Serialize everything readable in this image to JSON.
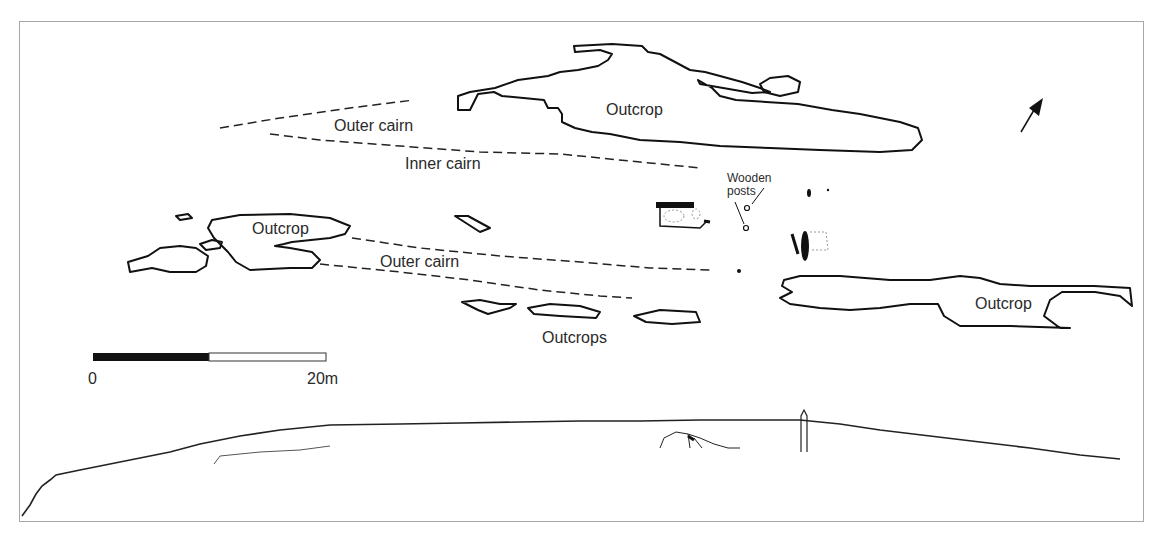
{
  "figure": {
    "type": "site-plan-and-profile",
    "labels": {
      "outcrop_top": "Outcrop",
      "outer_cairn_top": "Outer cairn",
      "inner_cairn": "Inner cairn",
      "wooden_posts_line1": "Wooden",
      "wooden_posts_line2": "posts",
      "outcrop_left": "Outcrop",
      "outer_cairn_bottom": "Outer cairn",
      "outcrops": "Outcrops",
      "outcrop_right": "Outcrop"
    },
    "scale_bar": {
      "start_label": "0",
      "end_label": "20m",
      "segments": [
        "black",
        "white"
      ]
    },
    "north_arrow": {
      "direction": "north-east"
    },
    "profile": {
      "description": "elevation section along ridge"
    },
    "colors": {
      "line": "#111111",
      "background": "#ffffff",
      "frame": "#a8a8a8"
    }
  }
}
